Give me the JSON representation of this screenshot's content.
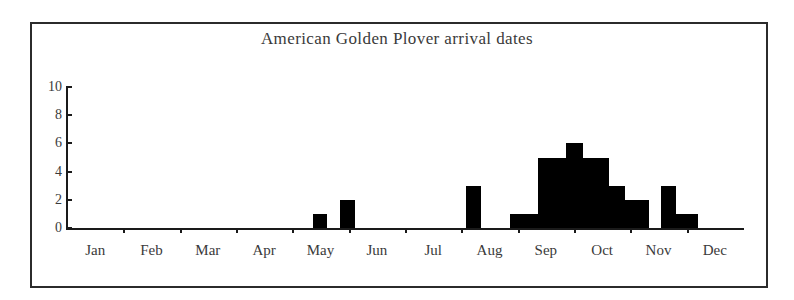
{
  "chart_data": {
    "type": "bar",
    "title": "American Golden Plover arrival dates",
    "xlabel": "",
    "ylabel": "",
    "ylim": [
      0,
      10
    ],
    "yticks": [
      0,
      2,
      4,
      6,
      8,
      10
    ],
    "grid": false,
    "legend": null,
    "categories": [
      "Jan",
      "Feb",
      "Mar",
      "Apr",
      "May",
      "Jun",
      "Jul",
      "Aug",
      "Sep",
      "Oct",
      "Nov",
      "Dec"
    ],
    "note": "Weekly histogram of counts across the calendar year; bars are placed at week positions within the labelled months.",
    "bars": [
      {
        "label": "May wk2",
        "month": "May",
        "value": 1,
        "x": 246,
        "width": 14
      },
      {
        "label": "May wk4",
        "month": "May",
        "value": 2,
        "x": 273,
        "width": 15
      },
      {
        "label": "Aug wk2",
        "month": "Aug",
        "value": 3,
        "x": 399,
        "width": 15
      },
      {
        "label": "Aug wk4",
        "month": "Aug",
        "value": 1,
        "x": 443,
        "width": 28
      },
      {
        "label": "Sep wk1",
        "month": "Sep",
        "value": 5,
        "x": 471,
        "width": 28
      },
      {
        "label": "Sep wk2",
        "month": "Sep",
        "value": 6,
        "x": 499,
        "width": 17
      },
      {
        "label": "Sep wk3",
        "month": "Sep",
        "value": 5,
        "x": 516,
        "width": 26
      },
      {
        "label": "Sep wk4",
        "month": "Sep",
        "value": 3,
        "x": 542,
        "width": 16
      },
      {
        "label": "Oct wk1",
        "month": "Oct",
        "value": 2,
        "x": 558,
        "width": 24
      },
      {
        "label": "Oct wk3",
        "month": "Oct",
        "value": 3,
        "x": 594,
        "width": 15
      },
      {
        "label": "Oct wk4",
        "month": "Oct",
        "value": 1,
        "x": 609,
        "width": 22
      }
    ],
    "monthly_totals": {
      "Jan": 0,
      "Feb": 0,
      "Mar": 0,
      "Apr": 0,
      "May": 3,
      "Jun": 0,
      "Jul": 0,
      "Aug": 4,
      "Sep": 19,
      "Oct": 6,
      "Nov": 0,
      "Dec": 0
    },
    "colors": {
      "bar_fill": "#000000",
      "axis": "#1a1a1a",
      "text": "#3a3a3a",
      "frame": "#2b2b2b",
      "background": "#ffffff"
    }
  }
}
